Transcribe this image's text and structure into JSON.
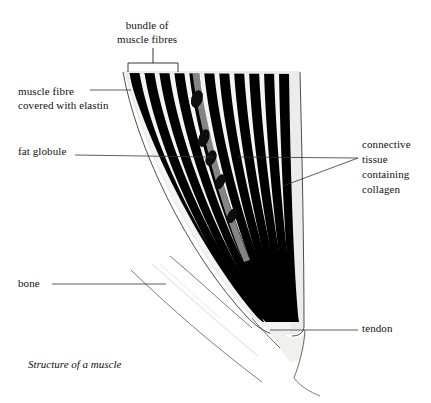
{
  "figure": {
    "caption": "Structure of a muscle",
    "title_label": "bundle of muscle fibres",
    "background_color": "#ffffff",
    "ink_color": "#111111",
    "fibre_color": "#000000",
    "tissue_color": "#e8e8e6",
    "globule_color": "#141414"
  },
  "labels": {
    "bundle_line1": "bundle of",
    "bundle_line2": "muscle fibres",
    "fibre_line1": "muscle fibre",
    "fibre_line2": "covered with elastin",
    "fat_globule": "fat globule",
    "connective_line1": "connective",
    "connective_line2": "tissue",
    "connective_line3": "containing",
    "connective_line4": "collagen",
    "bone": "bone",
    "tendon": "tendon"
  },
  "diagram": {
    "type": "anatomical-illustration",
    "parts": [
      "bundle of muscle fibres",
      "muscle fibre covered with elastin",
      "fat globule",
      "connective tissue containing collagen",
      "bone",
      "tendon"
    ],
    "fibre_count": 11,
    "fat_globule_count": 5
  }
}
